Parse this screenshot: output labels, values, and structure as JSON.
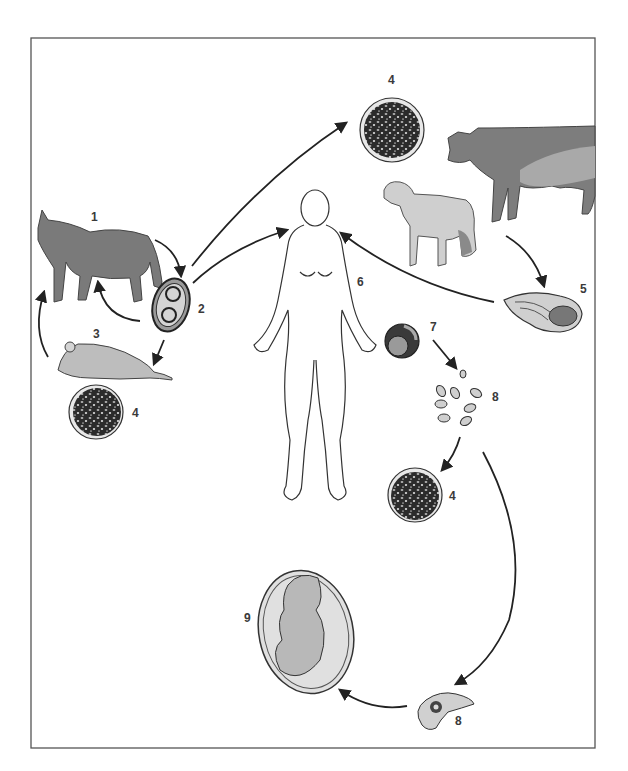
{
  "diagram": {
    "type": "life-cycle",
    "frame": {
      "x": 31,
      "y": 38,
      "width": 564,
      "height": 710,
      "stroke": "#555555"
    },
    "colors": {
      "line": "#222222",
      "cat_fill": "#7a7a7a",
      "cow_fill": "#7d7d7d",
      "cow_patch": "#a9a9a9",
      "sheep_fill": "#cfcfcf",
      "mouse_fill": "#bdbdbd",
      "cyst_fill": "#2b2b2b",
      "fetus_fill": "#b8b8b8"
    },
    "nodes": [
      {
        "id": "cat",
        "label": "1",
        "desc": "cat (definitive host)"
      },
      {
        "id": "oocyst",
        "label": "2",
        "desc": "sporulated oocyst"
      },
      {
        "id": "mouse",
        "label": "3",
        "desc": "rodent (intermediate host)"
      },
      {
        "id": "tissue-cyst-top",
        "label": "4",
        "desc": "tissue cyst"
      },
      {
        "id": "tissue-cyst-mouse",
        "label": "4",
        "desc": "tissue cyst in rodent"
      },
      {
        "id": "tissue-cyst-human",
        "label": "4",
        "desc": "tissue cyst in human"
      },
      {
        "id": "meat",
        "label": "5",
        "desc": "undercooked meat"
      },
      {
        "id": "human",
        "label": "6",
        "desc": "human host"
      },
      {
        "id": "ingested-cyst",
        "label": "7",
        "desc": "ingested cyst"
      },
      {
        "id": "tachyzoites",
        "label": "8",
        "desc": "tachyzoites"
      },
      {
        "id": "tachyzoite-single",
        "label": "8",
        "desc": "tachyzoite (transplacental)"
      },
      {
        "id": "fetus",
        "label": "9",
        "desc": "fetus (congenital infection)"
      },
      {
        "id": "cow",
        "label": "",
        "desc": "cattle"
      },
      {
        "id": "sheep",
        "label": "",
        "desc": "sheep"
      }
    ],
    "edges": [
      {
        "from": "cat",
        "to": "oocyst"
      },
      {
        "from": "oocyst",
        "to": "cat"
      },
      {
        "from": "oocyst",
        "to": "mouse"
      },
      {
        "from": "mouse",
        "to": "cat"
      },
      {
        "from": "oocyst",
        "to": "tissue-cyst-top"
      },
      {
        "from": "oocyst",
        "to": "human"
      },
      {
        "from": "cow",
        "to": "meat"
      },
      {
        "from": "meat",
        "to": "human"
      },
      {
        "from": "ingested-cyst",
        "to": "tachyzoites"
      },
      {
        "from": "tachyzoites",
        "to": "tissue-cyst-human"
      },
      {
        "from": "tachyzoites",
        "to": "tachyzoite-single"
      },
      {
        "from": "tachyzoite-single",
        "to": "fetus"
      }
    ]
  }
}
